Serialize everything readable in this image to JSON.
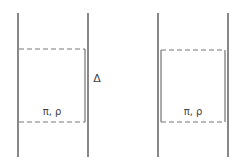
{
  "diagram": {
    "left_panel": {
      "region_label": "π, ρ",
      "gap_label": "Δ"
    },
    "right_panel": {
      "region_label": "π, ρ"
    }
  },
  "colors": {
    "line": "#555555",
    "background": "#ffffff"
  }
}
